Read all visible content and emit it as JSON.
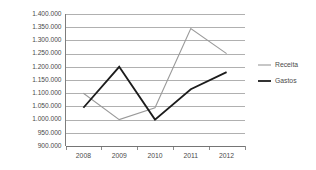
{
  "chart_data": {
    "type": "line",
    "title": "",
    "subtitle": "",
    "xlabel": "",
    "ylabel": "",
    "categories": [
      "2008",
      "2009",
      "2010",
      "2011",
      "2012"
    ],
    "series": [
      {
        "name": "Receita",
        "color": "#9a9a9a",
        "values": [
          1100000,
          1000000,
          1045000,
          1345000,
          1250000
        ]
      },
      {
        "name": "Gastos",
        "color": "#1c1c1c",
        "values": [
          1045000,
          1200000,
          1000000,
          1115000,
          1180000
        ]
      }
    ],
    "ylim": [
      900000,
      1400000
    ],
    "ystep": 50000,
    "ytick_labels": [
      "1.400.000",
      "1.350.000",
      "1.300.000",
      "1.250.000",
      "1.200.000",
      "1.150.000",
      "1.100.000",
      "1.050.000",
      "1.000.000",
      "950.000",
      "900.000"
    ],
    "ytick_values": [
      1400000,
      1350000,
      1300000,
      1250000,
      1200000,
      1150000,
      1100000,
      1050000,
      1000000,
      950000,
      900000
    ],
    "grid": "horizontal",
    "legend_position": "right",
    "legend_entries": [
      {
        "label": "Receita",
        "color": "#9a9a9a",
        "line_width": "thin"
      },
      {
        "label": "Gastos",
        "color": "#1c1c1c",
        "line_width": "thick"
      }
    ]
  }
}
